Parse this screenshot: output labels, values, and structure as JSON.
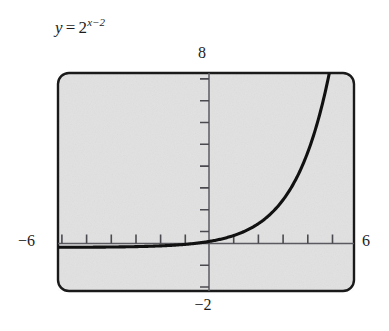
{
  "figure": {
    "equation": {
      "lhs": "y",
      "relation": "=",
      "base": "2",
      "exponent": "x−2",
      "plain": "y = 2^(x-2)"
    },
    "axis_labels": {
      "top": "8",
      "left": "−6",
      "right": "6",
      "bottom": "−2"
    },
    "style": {
      "plot_fill": "#e8e8e8",
      "frame_stroke": "#1a1a1a",
      "axis_stroke": "#55555a",
      "curve_stroke": "#111111",
      "text_color": "#1c1c1c"
    }
  },
  "chart_data": {
    "type": "line",
    "xlabel": "",
    "ylabel": "",
    "xlim": [
      -6,
      6
    ],
    "ylim": [
      -2,
      8
    ],
    "grid": false,
    "legend": null,
    "x_tick_step": 1,
    "y_tick_step": 1,
    "function": "y = 2^(x-2)",
    "series": [
      {
        "name": "y = 2^(x-2)",
        "x": [
          -6,
          -5,
          -4,
          -3,
          -2,
          -1,
          0,
          1,
          2,
          3,
          4,
          5,
          5.05
        ],
        "y": [
          0.0039,
          0.0078,
          0.0156,
          0.0313,
          0.0625,
          0.125,
          0.25,
          0.5,
          1,
          2,
          4,
          8,
          8.28
        ]
      }
    ],
    "annotations": [
      {
        "text": "8",
        "position": "top-of-y-axis"
      },
      {
        "text": "-6",
        "position": "left-of-x-axis"
      },
      {
        "text": "6",
        "position": "right-of-x-axis"
      },
      {
        "text": "-2",
        "position": "bottom-of-y-axis"
      }
    ]
  }
}
